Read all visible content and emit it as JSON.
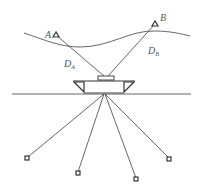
{
  "diagram": {
    "labels": {
      "station_a": "A",
      "station_b": "B",
      "distance_a": "D",
      "distance_a_sub": "A",
      "distance_b": "D",
      "distance_b_sub": "B"
    },
    "colors": {
      "stroke": "#555555",
      "background": "#ffffff"
    },
    "seabed_beacons_count": 4
  }
}
